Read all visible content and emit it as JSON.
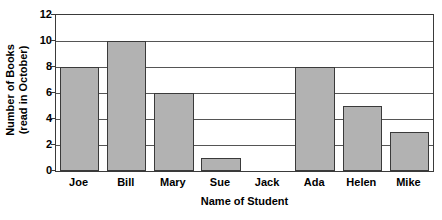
{
  "chart_data": {
    "type": "bar",
    "title": "",
    "subtitle": "",
    "xlabel": "Name of Student",
    "ylabel_line1": "Number of Books",
    "ylabel_line2": "(read in October)",
    "categories": [
      "Joe",
      "Bill",
      "Mary",
      "Sue",
      "Jack",
      "Ada",
      "Helen",
      "Mike"
    ],
    "values": [
      8,
      10,
      6,
      1,
      0,
      8,
      5,
      3
    ],
    "ylim": [
      0,
      12
    ],
    "yticks": [
      0,
      2,
      4,
      6,
      8,
      10,
      12
    ],
    "ytick_labels": [
      "0",
      "2",
      "4",
      "6",
      "8",
      "10",
      "12"
    ],
    "grid": true,
    "grid_axis": "y",
    "legend": false,
    "legend_position": "none",
    "bar_fill_color": "#b2b2b2",
    "bar_edge_color": "#3a3a3a",
    "axis_color": "#3a3a3a",
    "grid_color": "#555555",
    "background_color": "#ffffff"
  }
}
